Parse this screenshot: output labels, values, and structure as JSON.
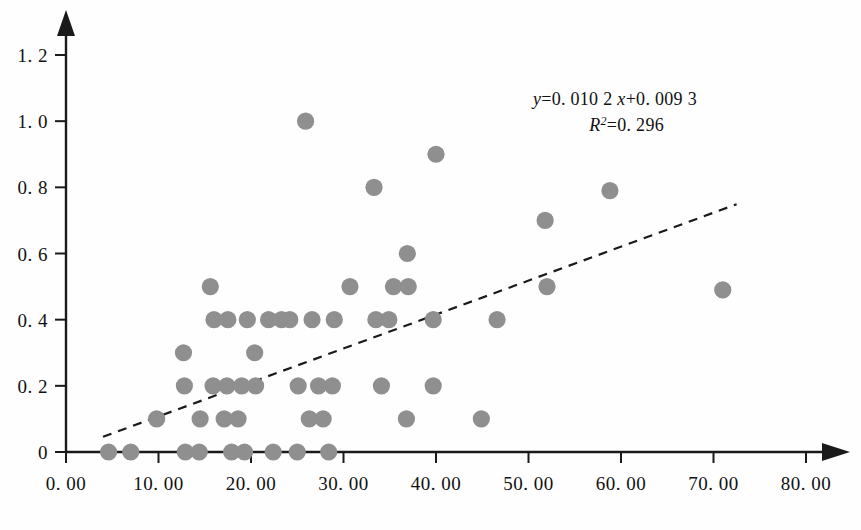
{
  "chart_data": {
    "type": "scatter",
    "title": "",
    "subtitle": "",
    "xlabel": "",
    "ylabel": "",
    "xlim": [
      0,
      80
    ],
    "ylim": [
      0,
      1.2
    ],
    "grid": false,
    "legend": "none",
    "x_ticks": [
      0,
      10,
      20,
      30,
      40,
      50,
      60,
      70,
      80
    ],
    "y_ticks": [
      0,
      0.2,
      0.4,
      0.6,
      0.8,
      1.0,
      1.2
    ],
    "x_tick_labels": [
      "0. 00",
      "10. 00",
      "20. 00",
      "30. 00",
      "40. 00",
      "50. 00",
      "60. 00",
      "70. 00",
      "80. 00"
    ],
    "y_tick_labels": [
      "0",
      "0. 2",
      "0. 4",
      "0. 6",
      "0. 8",
      "1. 0",
      "1. 2"
    ],
    "annotations": [
      {
        "name": "regression-equation",
        "text": "y=0. 010 2x+0. 009 3"
      },
      {
        "name": "r-squared",
        "text": "R²=0. 296"
      }
    ],
    "equation": {
      "y_symbol": "y",
      "equals": "=",
      "slope_text": "0. 010 2",
      "x_symbol": "x",
      "plus": "+",
      "intercept_text": "0. 009 3",
      "r_symbol": "R",
      "r_exponent": "2",
      "r_equals": "=",
      "r_value": "0. 296"
    },
    "series": [
      {
        "name": "observations",
        "marker": "circle",
        "color": "#8f8f8f",
        "points": [
          [
            4.6,
            0.0
          ],
          [
            7.0,
            0.0
          ],
          [
            12.9,
            0.0
          ],
          [
            14.4,
            0.0
          ],
          [
            17.9,
            0.0
          ],
          [
            19.3,
            0.0
          ],
          [
            22.4,
            0.0
          ],
          [
            25.0,
            0.0
          ],
          [
            28.4,
            0.0
          ],
          [
            9.8,
            0.1
          ],
          [
            14.5,
            0.1
          ],
          [
            17.1,
            0.1
          ],
          [
            18.6,
            0.1
          ],
          [
            26.3,
            0.1
          ],
          [
            27.8,
            0.1
          ],
          [
            36.8,
            0.1
          ],
          [
            44.9,
            0.1
          ],
          [
            12.8,
            0.2
          ],
          [
            15.9,
            0.2
          ],
          [
            17.4,
            0.2
          ],
          [
            19.0,
            0.2
          ],
          [
            20.5,
            0.2
          ],
          [
            25.1,
            0.2
          ],
          [
            27.3,
            0.2
          ],
          [
            28.8,
            0.2
          ],
          [
            34.1,
            0.2
          ],
          [
            39.7,
            0.2
          ],
          [
            12.7,
            0.3
          ],
          [
            20.4,
            0.3
          ],
          [
            16.0,
            0.4
          ],
          [
            17.5,
            0.4
          ],
          [
            19.6,
            0.4
          ],
          [
            21.9,
            0.4
          ],
          [
            23.3,
            0.4
          ],
          [
            24.2,
            0.4
          ],
          [
            26.6,
            0.4
          ],
          [
            29.0,
            0.4
          ],
          [
            33.5,
            0.4
          ],
          [
            34.9,
            0.4
          ],
          [
            39.7,
            0.4
          ],
          [
            46.6,
            0.4
          ],
          [
            15.6,
            0.5
          ],
          [
            30.7,
            0.5
          ],
          [
            35.4,
            0.5
          ],
          [
            37.0,
            0.5
          ],
          [
            52.0,
            0.5
          ],
          [
            71.0,
            0.49
          ],
          [
            36.9,
            0.6
          ],
          [
            51.8,
            0.7
          ],
          [
            33.3,
            0.8
          ],
          [
            58.8,
            0.79
          ],
          [
            40.0,
            0.9
          ],
          [
            25.9,
            1.0
          ]
        ]
      }
    ],
    "trendline": {
      "name": "linear-fit",
      "style": "dashed",
      "color": "#1a1a1a",
      "x_start": 4.0,
      "y_start": 0.046,
      "x_end": 72.5,
      "y_end": 0.749
    }
  }
}
